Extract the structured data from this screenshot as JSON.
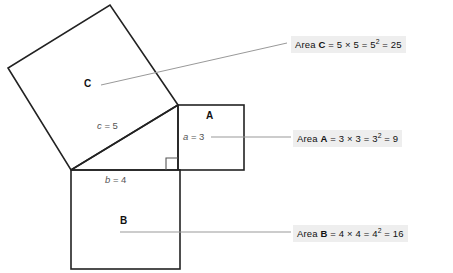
{
  "diagram": {
    "title_text": "",
    "squares": [
      {
        "key": "A",
        "label": "A",
        "side_label": "a = 3"
      },
      {
        "key": "B",
        "label": "B",
        "side_label": "b = 4"
      },
      {
        "key": "C",
        "label": "C",
        "side_label": "c = 5"
      }
    ],
    "side_labels": {
      "a": "a = 3",
      "a_var": "a",
      "a_val": " = 3",
      "b_var": "b",
      "b_val": " = 4",
      "c_var": "c",
      "c_val": " = 5"
    },
    "callouts": [
      {
        "key": "C",
        "prefix": "Area ",
        "name": "C",
        "expr_1": " = 5 × 5 = 5",
        "exp": "2",
        "expr_2": " = 25",
        "full_text": "Area C = 5 × 5 = 5² = 25"
      },
      {
        "key": "A",
        "prefix": "Area ",
        "name": "A",
        "expr_1": " = 3 × 3 = 3",
        "exp": "2",
        "expr_2": " = 9",
        "full_text": "Area A = 3 × 3 = 3² = 9"
      },
      {
        "key": "B",
        "prefix": "Area ",
        "name": "B",
        "expr_1": " = 4 × 4 = 4",
        "exp": "2",
        "expr_2": " = 16",
        "full_text": "Area B = 4 × 4 = 4² = 16"
      }
    ],
    "colors": {
      "background": "#ffffff",
      "stroke": "#222222",
      "leader": "#999999",
      "label_text": "#111111",
      "side_text": "#555555",
      "callout_bg": "#eeeeee"
    },
    "right_angle_marker": "right-angle-square"
  }
}
